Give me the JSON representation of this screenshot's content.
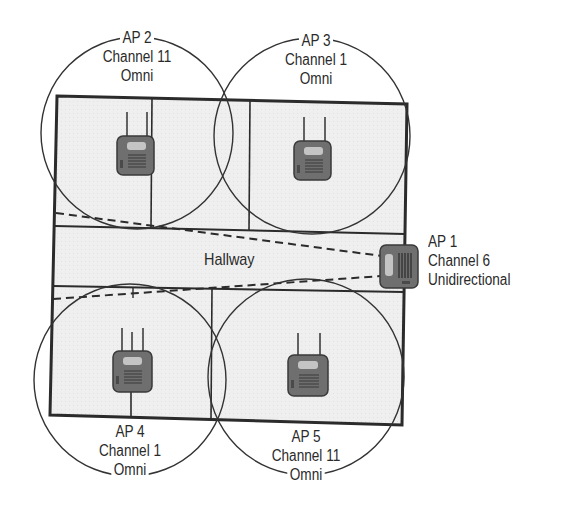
{
  "diagram": {
    "hallway_label": "Hallway",
    "colors": {
      "floor": "#efefef",
      "wall": "#2b2b2b",
      "coverage_circle": "#333333",
      "device_body": "#6f6f6f",
      "device_screen": "#c4c4c4",
      "text": "#2a2a2a"
    },
    "access_points": [
      {
        "name": "AP 1",
        "channel": "Channel 6",
        "antenna": "Unidirectional"
      },
      {
        "name": "AP 2",
        "channel": "Channel 11",
        "antenna": "Omni"
      },
      {
        "name": "AP 3",
        "channel": "Channel 1",
        "antenna": "Omni"
      },
      {
        "name": "AP 4",
        "channel": "Channel 1",
        "antenna": "Omni"
      },
      {
        "name": "AP 5",
        "channel": "Channel 11",
        "antenna": "Omni"
      }
    ]
  }
}
